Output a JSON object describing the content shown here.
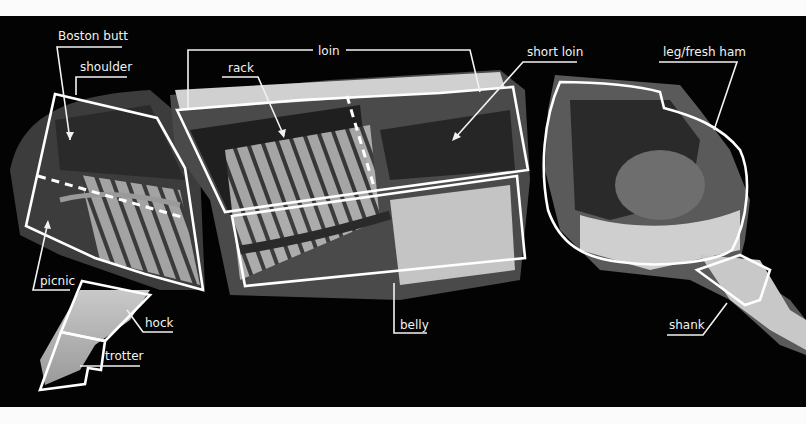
{
  "diagram": {
    "background_color": "#030303",
    "line_color": "#ffffff",
    "pieces": [
      {
        "name": "shoulder-section"
      },
      {
        "name": "loin-belly-section"
      },
      {
        "name": "leg-section"
      }
    ],
    "labels": {
      "boston_butt": "Boston butt",
      "shoulder": "shoulder",
      "loin": "loin",
      "rack": "rack",
      "short_loin": "short loin",
      "leg_fresh_ham": "leg/fresh ham",
      "picnic": "picnic",
      "hock": "hock",
      "trotter": "trotter",
      "belly": "belly",
      "shank": "shank"
    }
  }
}
